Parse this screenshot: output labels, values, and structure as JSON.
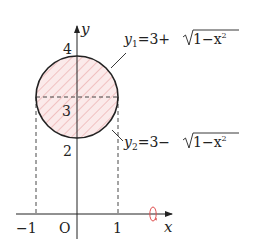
{
  "diagram": {
    "axes": {
      "x_label": "x",
      "y_label": "y",
      "origin_label": "O",
      "x_ticks": [
        "−1",
        "1"
      ],
      "y_ticks": [
        "4",
        "3",
        "2"
      ]
    },
    "curves": {
      "upper": {
        "var": "y",
        "sub": "1",
        "expr_left": "=3+",
        "radicand": "1−x",
        "exp": "2"
      },
      "lower": {
        "var": "y",
        "sub": "2",
        "expr_left": "=3−",
        "radicand": "1−x",
        "exp": "2"
      }
    },
    "circle": {
      "center": [
        0,
        3
      ],
      "radius": 1
    },
    "rotation_axis": "x",
    "colors": {
      "stroke": "#222222",
      "hatch": "#e8a0a0",
      "fill": "#fbeaea",
      "rotation": "#e05050"
    }
  }
}
